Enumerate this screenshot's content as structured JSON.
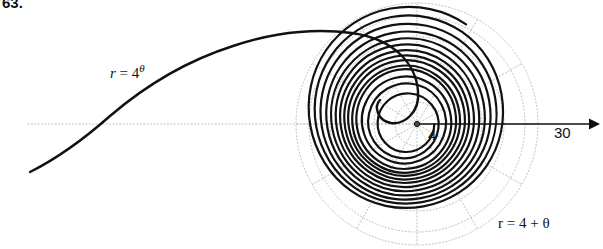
{
  "figure": {
    "number": "63.",
    "domain": "polar-plot",
    "background_color": "#ffffff",
    "width": 603,
    "height": 249
  },
  "labels": {
    "exponential_spiral": {
      "prefix": "r",
      "equals": "=",
      "base": "4",
      "exponent": "θ"
    },
    "archimedean_spiral": "r = 4 + θ",
    "pole_value": "4",
    "axis_end_value": "30"
  },
  "chart_data": {
    "type": "line",
    "title": "",
    "subtitle": "",
    "xlabel": "",
    "ylabel": "",
    "coordinate_system": "polar",
    "grid": true,
    "legend_position": "inline-annotations",
    "pole": {
      "x_px": 417,
      "y_px": 124,
      "label": "4"
    },
    "polar_axis": {
      "direction": "right",
      "arrow": true,
      "start_value": 0,
      "end_value": 30,
      "end_label": "30",
      "end_x_px": 597,
      "tick_values": [
        4,
        10,
        16,
        22,
        28,
        30
      ],
      "pixels_per_unit": 4.33
    },
    "grid_circles": {
      "radii_units": [
        5,
        10,
        15,
        20,
        25,
        28
      ],
      "radii_px": [
        22,
        43,
        65,
        87,
        108,
        121
      ],
      "style": "dotted",
      "color": "#bdbdbd"
    },
    "grid_rays": {
      "angles_deg": [
        0,
        30,
        60,
        90,
        120,
        150,
        180,
        210,
        240,
        270,
        300,
        330
      ],
      "style": "dotted",
      "color": "#bdbdbd",
      "max_radius_px": 121
    },
    "series": [
      {
        "name": "r = 4 + θ",
        "equation": "r = 4 + theta",
        "type": "archimedean-spiral",
        "color": "#111111",
        "line_width": 2.2,
        "theta_range_rad": [
          0,
          25.1
        ],
        "r_range_units": [
          4,
          29.1
        ],
        "label_text": "r = 4 + θ",
        "label_x_px": 498,
        "label_y_px": 215
      },
      {
        "name": "r = 4^θ",
        "equation": "r = 4^theta",
        "type": "logarithmic-spiral",
        "color": "#111111",
        "line_width": 2.2,
        "theta_range_rad": [
          -1.0,
          2.45
        ],
        "label_text": "r = 4^θ",
        "label_x_px": 110,
        "label_y_px": 62
      }
    ]
  }
}
